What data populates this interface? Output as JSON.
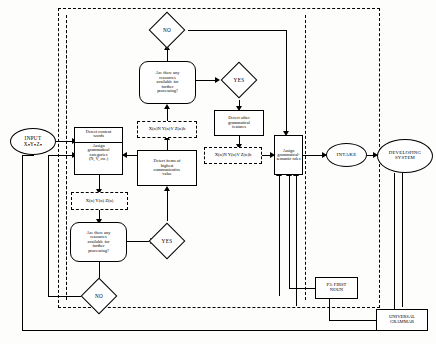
{
  "diagram": {
    "nodes": {
      "input": {
        "line1": "INPUT",
        "line2": "XₙYₙZₙ"
      },
      "detect_content": {
        "line1": "Detect content",
        "line2": "words"
      },
      "assign_categories": {
        "line1": "Assign",
        "line2": "grammatical",
        "line3": "categories",
        "line4": "(N, V, etc.)"
      },
      "dashed_mid_left": {
        "text": "X(n)N Y(n)V Z(n)b"
      },
      "dashed_lower_left": {
        "text": "X(n) Y(n) Z(n)"
      },
      "dashed_mid_right": {
        "text": "X(n)N Y(n)V Z(n)b"
      },
      "resources_top": {
        "line1": "Are there any",
        "line2": "resources",
        "line3": "available for",
        "line4": "further",
        "line5": "processing?"
      },
      "resources_bottom": {
        "line1": "Are there any",
        "line2": "resources",
        "line3": "available for",
        "line4": "further",
        "line5": "processing?"
      },
      "detect_other": {
        "line1": "Detect other",
        "line2": "grammatical",
        "line3": "features"
      },
      "detect_items": {
        "line1": "Detect items of",
        "line2": "highest",
        "line3": "communicative",
        "line4": "value"
      },
      "assign_roles": {
        "line1": "Assign",
        "line2": "grammatical-",
        "line3": "semantic roles"
      },
      "intake": {
        "text": "INTAKE"
      },
      "developing": {
        "line1": "DEVELOPING",
        "line2": "SYSTEM"
      },
      "first_noun": {
        "line1": "P3: FIRST",
        "line2": "NOUN"
      },
      "universal_grammar": {
        "line1": "UNIVERSAL",
        "line2": "GRAMMAR"
      }
    },
    "decisions": {
      "no_top": "NO",
      "yes_top": "YES",
      "yes_bottom": "YES",
      "no_bottom": "NO"
    },
    "colors": {
      "stroke": "#000000",
      "background": "#ffffff"
    }
  }
}
